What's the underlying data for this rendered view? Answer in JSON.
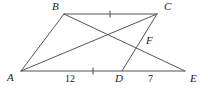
{
  "figure": {
    "kind": "geometry-diagram",
    "width": 208,
    "height": 90,
    "background_color": "#ffffff",
    "stroke_color": "#555555",
    "text_color": "#1c1c1c"
  },
  "points": {
    "A": {
      "label": "A",
      "x": 21,
      "y": 71,
      "label_x": 7,
      "label_y": 72
    },
    "B": {
      "label": "B",
      "x": 64,
      "y": 14,
      "label_x": 52,
      "label_y": 1
    },
    "C": {
      "label": "C",
      "x": 157,
      "y": 14,
      "label_x": 164,
      "label_y": 1
    },
    "D": {
      "label": "D",
      "x": 122,
      "y": 71,
      "label_x": 115,
      "label_y": 73
    },
    "E": {
      "label": "E",
      "x": 185,
      "y": 71,
      "label_x": 190,
      "label_y": 73
    },
    "F": {
      "label": "F",
      "x": 141,
      "y": 43,
      "label_x": 146,
      "label_y": 35
    }
  },
  "segments": [
    {
      "name": "segment-AB",
      "from": "A",
      "to": "B",
      "x1": 21,
      "y1": 71,
      "x2": 64,
      "y2": 14
    },
    {
      "name": "segment-BC",
      "from": "B",
      "to": "C",
      "x1": 64,
      "y1": 14,
      "x2": 157,
      "y2": 14
    },
    {
      "name": "segment-AE",
      "from": "A",
      "to": "E",
      "x1": 21,
      "y1": 71,
      "x2": 185,
      "y2": 71
    },
    {
      "name": "segment-AC",
      "from": "A",
      "to": "C",
      "x1": 21,
      "y1": 71,
      "x2": 157,
      "y2": 14
    },
    {
      "name": "segment-BE",
      "from": "B",
      "to": "E",
      "x1": 64,
      "y1": 14,
      "x2": 185,
      "y2": 71
    },
    {
      "name": "segment-CD",
      "from": "C",
      "to": "D",
      "x1": 157,
      "y1": 14,
      "x2": 122,
      "y2": 71
    }
  ],
  "tick_marks": [
    {
      "name": "tick-on-BC",
      "x": 110,
      "y": 14,
      "orientation": "vertical"
    },
    {
      "name": "tick-on-AD",
      "x": 93,
      "y": 71,
      "orientation": "vertical"
    }
  ],
  "measurements": [
    {
      "name": "length-AD",
      "value": "12",
      "x": 65,
      "y": 74,
      "segment": "A-D"
    },
    {
      "name": "length-DE",
      "value": "7",
      "x": 148,
      "y": 74,
      "segment": "D-E"
    }
  ]
}
